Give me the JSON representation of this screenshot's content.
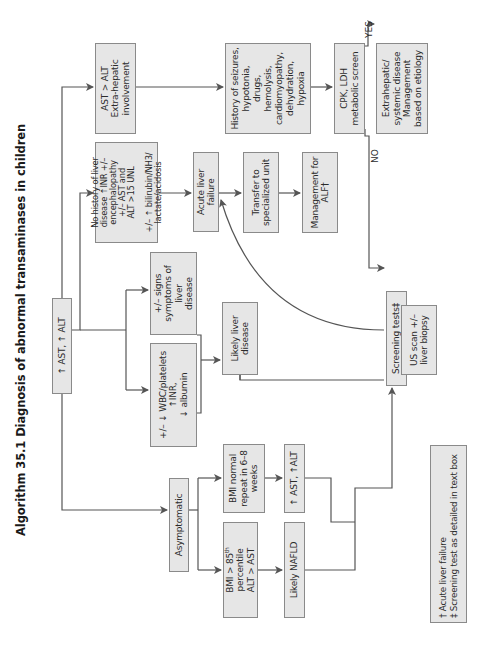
{
  "title": "Algorithm 35.1  Diagnosis of abnormal transaminases in children",
  "colors": {
    "box_fill": "#e6e6e6",
    "box_border": "#8a8a8a",
    "line": "#555555",
    "text": "#2b2b2b"
  },
  "nodes": {
    "start": "↑ AST, ↑ ALT",
    "ast_gt_alt": "AST > ALT\nExtra-hepatic\ninvolvement",
    "no_history": "No history of liver\ndisease ↑INR +/–\nencephalopathy\n+/– AST and\nALT >15 UNL\n\n+/– ↑ bilirubin/NH3/\nlactate/acidosis",
    "signs_symptoms": "+/– signs\nsymptoms of liver\ndisease",
    "wbc_platelets": "+/– ↓ WBC/platelets\n↑INR,\n↓ albumin",
    "asymptomatic": "Asymptomatic",
    "history_seizures": "History of seizures,\nhypotonia,\ndrugs,\nhemolysis,\ncardiomyopathy,\ndehydration,\nhypoxia",
    "acute_liver_failure": "Acute liver\nfailure",
    "likely_liver_disease": "Likely liver\ndisease",
    "bmi_gt_85": "BMI > 85th percentile\nALT > AST",
    "bmi_normal": "BMI normal\nrepeat in 6–8\nweeks",
    "transfer": "Transfer to\nspecialized unit",
    "ast_alt_repeat": "↑ AST, ↑ALT",
    "likely_nafld": "Likely NAFLD",
    "cpk_ldh": "CPK, LDH\nmetabolic screen",
    "management_alf": "Management for\nALF†",
    "screening_tests": "Screening tests‡",
    "extrahepatic": "Extrahepatic/\nsystemic disease\nManagement\nbased on etiology",
    "us_scan": "US scan +/–\nliver biopsy"
  },
  "edge_labels": {
    "yes": "YES",
    "no": "NO"
  },
  "footnotes": {
    "dagger": "† Acute liver failure",
    "double_dagger": "‡ Screening test as detailed in text box"
  }
}
